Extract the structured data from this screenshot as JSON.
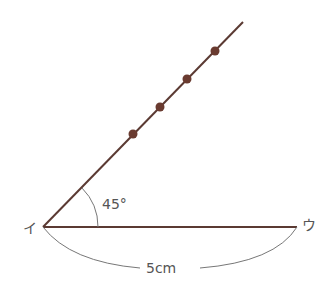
{
  "diagram": {
    "vertex_label": "イ",
    "end_label": "ウ",
    "angle_label": "45°",
    "length_label": "5cm",
    "line_color": "#5b3a33",
    "dot_color": "#6a3b30",
    "label_color": "#555555",
    "points": {
      "vertex": [
        43,
        227
      ],
      "horizontal_end": [
        297,
        227
      ],
      "ray_end": [
        243,
        22
      ],
      "dots": [
        [
          133,
          134
        ],
        [
          160,
          107
        ],
        [
          187,
          79
        ],
        [
          215,
          51
        ]
      ]
    }
  }
}
